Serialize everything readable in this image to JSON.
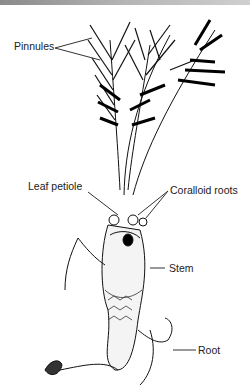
{
  "figure": {
    "labels": {
      "pinnules": "Pinnules",
      "leaf_petiole": "Leaf petiole",
      "coralloid_roots": "Coralloid roots",
      "stem": "Stem",
      "root": "Root"
    }
  }
}
